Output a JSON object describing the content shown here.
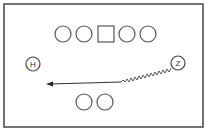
{
  "diagram": {
    "type": "football-play",
    "players": {
      "line": [
        "O",
        "O",
        "C",
        "O",
        "O"
      ],
      "left_back": "H",
      "right_wide": "Z",
      "bottom": [
        "O",
        "O"
      ]
    },
    "route": {
      "from": "Z",
      "style": "motion-zigzag-then-arrow",
      "direction": "left"
    },
    "colors": {
      "stroke": "#555555",
      "background": "#ffffff"
    }
  }
}
